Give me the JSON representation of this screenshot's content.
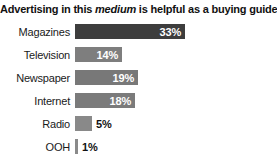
{
  "title": {
    "prefix": "Advertising in this ",
    "emphasis": "medium",
    "suffix": " is helpful as a buying guide"
  },
  "chart_data": {
    "type": "bar",
    "orientation": "horizontal",
    "title": "Advertising in this medium is helpful as a buying guide",
    "categories": [
      "Magazines",
      "Television",
      "Newspaper",
      "Internet",
      "Radio",
      "OOH"
    ],
    "values": [
      33,
      14,
      19,
      18,
      5,
      1
    ],
    "value_labels": [
      "33%",
      "14%",
      "19%",
      "18%",
      "5%",
      "1%"
    ],
    "unit": "%",
    "xlim": [
      0,
      33
    ],
    "grid": false,
    "legend": "none",
    "bar_colors": [
      "#3d3d3d",
      "#7e7e7e",
      "#787878",
      "#7b7b7b",
      "#898989",
      "#8a8a8a"
    ],
    "value_label_position_rule": "inside-right if bar wide enough, else outside-right",
    "colors": {
      "highlight_bar": "#3d3d3d",
      "regular_bar": "#7e7e7e",
      "inside_label": "#ffffff",
      "outside_label": "#111111",
      "background": "#ffffff"
    }
  }
}
